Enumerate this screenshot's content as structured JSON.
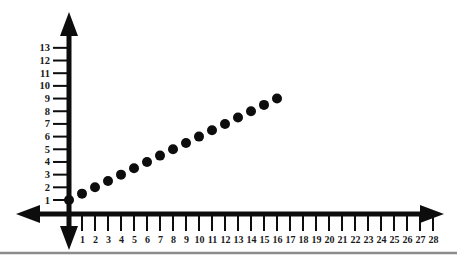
{
  "chart_data": {
    "type": "scatter",
    "title": "",
    "subtitle": "",
    "xlabel": "",
    "ylabel": "",
    "xlim": [
      0,
      28
    ],
    "ylim": [
      0,
      13
    ],
    "grid": false,
    "legend": false,
    "x_ticks": [
      1,
      2,
      3,
      4,
      5,
      6,
      7,
      8,
      9,
      10,
      11,
      12,
      13,
      14,
      15,
      16,
      17,
      18,
      19,
      20,
      21,
      22,
      23,
      24,
      25,
      26,
      27,
      28
    ],
    "y_ticks": [
      1,
      2,
      3,
      4,
      5,
      6,
      7,
      8,
      9,
      10,
      11,
      12,
      13
    ],
    "x_tick_labels": [
      "1",
      "2",
      "3",
      "4",
      "5",
      "6",
      "7",
      "8",
      "9",
      "10",
      "11",
      "12",
      "13",
      "14",
      "15",
      "16",
      "17",
      "18",
      "19",
      "20",
      "21",
      "22",
      "23",
      "24",
      "25",
      "26",
      "27",
      "28"
    ],
    "y_tick_labels": [
      "1",
      "2",
      "3",
      "4",
      "5",
      "6",
      "7",
      "8",
      "9",
      "10",
      "11",
      "12",
      "13"
    ],
    "series": [
      {
        "name": "points",
        "marker": "filled-circle",
        "color": "#0d0d0d",
        "x": [
          0,
          1,
          2,
          3,
          4,
          5,
          6,
          7,
          8,
          9,
          10,
          11,
          12,
          13,
          14,
          15,
          16
        ],
        "y": [
          1,
          1.5,
          2,
          2.5,
          3,
          3.5,
          4,
          4.5,
          5,
          5.5,
          6,
          6.5,
          7,
          7.5,
          8,
          8.5,
          9
        ]
      }
    ],
    "axis_style": {
      "color": "#0d0d0d",
      "x_axis_arrows": [
        "left",
        "right"
      ],
      "y_axis_arrows": [
        "up",
        "down"
      ],
      "line_width": 4
    },
    "footer_rule_color": "#8c8c8c"
  }
}
